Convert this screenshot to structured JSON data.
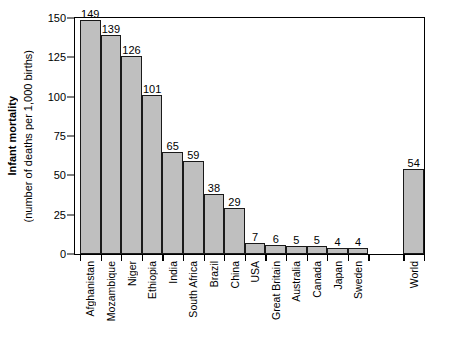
{
  "chart_data": {
    "type": "bar",
    "title": "",
    "xlabel": "",
    "ylabel": "Infant mortality (number of deaths per 1,000 births)",
    "ylabel_line1": "Infant mortality",
    "ylabel_line2": "(number of deaths per 1,000 births)",
    "ylim": [
      0,
      150
    ],
    "yticks": [
      0,
      25,
      50,
      75,
      100,
      125,
      150
    ],
    "ytick_labels": [
      "0",
      "25",
      "50",
      "75",
      "100",
      "125",
      "150"
    ],
    "grid": false,
    "legend": "none",
    "categories": [
      "Afghanistan",
      "Mozambique",
      "Niger",
      "Ethiopia",
      "India",
      "South Africa",
      "Brazil",
      "China",
      "USA",
      "Great Britain",
      "Australia",
      "Canada",
      "Japan",
      "Sweden",
      "World"
    ],
    "values": [
      149,
      139,
      126,
      101,
      65,
      59,
      38,
      29,
      7,
      6,
      5,
      5,
      4,
      4,
      54
    ],
    "value_labels": [
      "149",
      "139",
      "126",
      "101",
      "65",
      "59",
      "38",
      "29",
      "7",
      "6",
      "5",
      "5",
      "4",
      "4",
      "54"
    ],
    "bar_fill_color": "#bfbfbf",
    "bar_edge_color": "#1a1a1a",
    "background_color": "#ffffff",
    "separated_last_bar": true
  }
}
